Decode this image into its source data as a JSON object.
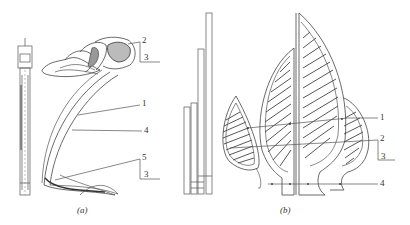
{
  "figure": {
    "panels": [
      {
        "id": "a",
        "caption": "(a)",
        "callouts": [
          {
            "label": "2",
            "x": 144,
            "y": 44
          },
          {
            "label": "3",
            "x": 145,
            "y": 61
          },
          {
            "label": "1",
            "x": 142,
            "y": 107
          },
          {
            "label": "4",
            "x": 144,
            "y": 132
          },
          {
            "label": "5",
            "x": 144,
            "y": 160
          },
          {
            "label": "3",
            "x": 145,
            "y": 178
          }
        ]
      },
      {
        "id": "b",
        "caption": "(b)",
        "callouts": [
          {
            "label": "1",
            "x": 381,
            "y": 120
          },
          {
            "label": "2",
            "x": 381,
            "y": 141
          },
          {
            "label": "3",
            "x": 382,
            "y": 158
          },
          {
            "label": "4",
            "x": 381,
            "y": 186
          }
        ]
      }
    ],
    "colors": {
      "line": "#555555",
      "hatch": "#444444",
      "background": "#ffffff"
    }
  }
}
